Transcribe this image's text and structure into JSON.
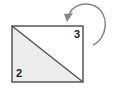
{
  "diagram": {
    "labels": {
      "lower_left_triangle": "2",
      "upper_right_triangle": "3"
    },
    "colors": {
      "stroke": "#555555",
      "lower_fill": "#ececec",
      "upper_fill": "#ffffff",
      "arrow": "#888888"
    },
    "arrow": {
      "direction": "counter-clockwise",
      "icon": "curved-arrow-icon"
    }
  }
}
